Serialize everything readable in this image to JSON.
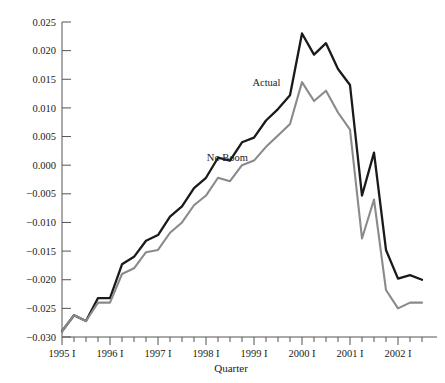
{
  "chart_data": {
    "type": "line",
    "title": "",
    "xlabel": "Quarter",
    "ylabel": "",
    "grid": false,
    "legend_position": "inline-annotations",
    "ylim": [
      -0.03,
      0.025
    ],
    "yticks": [
      0.025,
      0.02,
      0.015,
      0.01,
      0.005,
      0.0,
      -0.005,
      -0.01,
      -0.015,
      -0.02,
      -0.025,
      -0.03
    ],
    "ytick_labels": [
      "0.025",
      "0.020",
      "0.015",
      "0.010",
      "0.005",
      "0.000",
      "−0.005",
      "−0.010",
      "−0.015",
      "−0.020",
      "−0.025",
      "−0.030"
    ],
    "xtick_labels": [
      "1995 I",
      "1996 I",
      "1997 I",
      "1998 I",
      "1999 I",
      "2000 I",
      "2001 I",
      "2002 I"
    ],
    "x_major_indices": [
      0,
      4,
      8,
      12,
      16,
      20,
      24,
      28
    ],
    "x_quarters": [
      "1995 I",
      "1995 II",
      "1995 III",
      "1995 IV",
      "1996 I",
      "1996 II",
      "1996 III",
      "1996 IV",
      "1997 I",
      "1997 II",
      "1997 III",
      "1997 IV",
      "1998 I",
      "1998 II",
      "1998 III",
      "1998 IV",
      "1999 I",
      "1999 II",
      "1999 III",
      "1999 IV",
      "2000 I",
      "2000 II",
      "2000 III",
      "2000 IV",
      "2001 I",
      "2001 II",
      "2001 III",
      "2001 IV",
      "2002 I",
      "2002 II",
      "2002 III"
    ],
    "series": [
      {
        "name": "Actual",
        "color": "#1a1a1a",
        "label_x_index": 18.2,
        "label_y_value": 0.0138,
        "values": [
          -0.029,
          -0.0262,
          -0.0272,
          -0.0232,
          -0.0232,
          -0.0173,
          -0.016,
          -0.0132,
          -0.0122,
          -0.009,
          -0.0072,
          -0.004,
          -0.0022,
          0.0013,
          0.0008,
          0.004,
          0.0048,
          0.0078,
          0.0098,
          0.0122,
          0.023,
          0.0193,
          0.0213,
          0.0168,
          0.014,
          -0.0053,
          0.0022,
          -0.0148,
          -0.0198,
          -0.0192,
          -0.02
        ]
      },
      {
        "name": "No Boom",
        "color": "#8a8a8a",
        "label_x_index": 15.5,
        "label_y_value": 0.0008,
        "values": [
          -0.029,
          -0.0262,
          -0.0272,
          -0.024,
          -0.024,
          -0.019,
          -0.018,
          -0.0152,
          -0.0148,
          -0.0118,
          -0.01,
          -0.007,
          -0.0053,
          -0.0022,
          -0.0028,
          0.0,
          0.0008,
          0.0032,
          0.0052,
          0.0072,
          0.0145,
          0.0112,
          0.013,
          0.0092,
          0.0062,
          -0.0128,
          -0.006,
          -0.0218,
          -0.025,
          -0.024,
          -0.024
        ]
      }
    ]
  },
  "axes": {
    "x_axis_title": "Quarter"
  }
}
